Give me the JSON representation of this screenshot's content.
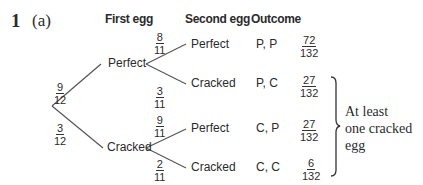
{
  "question": {
    "number": "1",
    "part": "(a)"
  },
  "headers": {
    "first_egg": "First egg",
    "second_egg": "Second egg",
    "outcome": "Outcome"
  },
  "tree": {
    "first_level": [
      {
        "label": "Perfect",
        "prob_num": "9",
        "prob_den": "12"
      },
      {
        "label": "Cracked",
        "prob_num": "3",
        "prob_den": "12"
      }
    ],
    "second_level": [
      {
        "parent": "Perfect",
        "label": "Perfect",
        "prob_num": "8",
        "prob_den": "11",
        "outcome": "P, P",
        "result_num": "72",
        "result_den": "132"
      },
      {
        "parent": "Perfect",
        "label": "Cracked",
        "prob_num": "3",
        "prob_den": "11",
        "outcome": "P, C",
        "result_num": "27",
        "result_den": "132"
      },
      {
        "parent": "Cracked",
        "label": "Perfect",
        "prob_num": "9",
        "prob_den": "11",
        "outcome": "C, P",
        "result_num": "27",
        "result_den": "132"
      },
      {
        "parent": "Cracked",
        "label": "Cracked",
        "prob_num": "2",
        "prob_den": "11",
        "outcome": "C, C",
        "result_num": "6",
        "result_den": "132"
      }
    ]
  },
  "brace_annotation": {
    "line1": "At least",
    "line2": "one cracked",
    "line3": "egg"
  },
  "colors": {
    "text": "#2b2b2b",
    "lines": "#555555",
    "background": "#ffffff"
  }
}
